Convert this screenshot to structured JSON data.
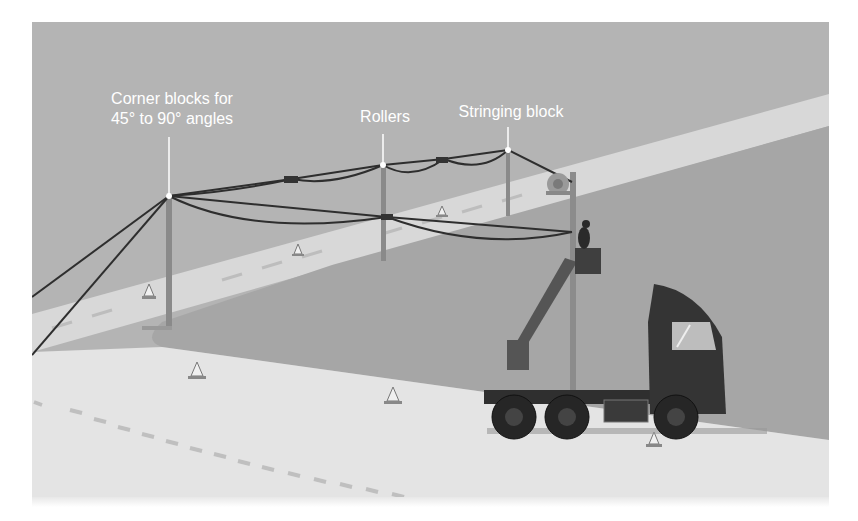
{
  "figure": {
    "labels": {
      "corner_blocks": "Corner blocks for 45° to 90° angles",
      "corner_blocks_line1": "Corner blocks for",
      "corner_blocks_line2": "45° to 90° angles",
      "rollers": "Rollers",
      "stringing_block": "Stringing block"
    },
    "elements": {
      "poles": 4,
      "traffic_cones": 7,
      "vehicle": "bucket truck (tractor cab with aerial lift)",
      "cable_reel": "reel near far pole",
      "worker": "lineman in bucket"
    },
    "colors": {
      "ground": "#b3b3b3",
      "road": "#dcdcdc",
      "shadow_area": "#a8a8a8",
      "cable": "#2e2e2e",
      "truck": "#3a3a3a",
      "label_text": "#ffffff"
    }
  }
}
